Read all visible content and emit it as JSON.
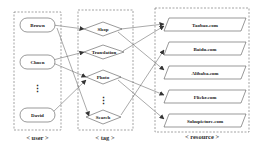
{
  "diagram": {
    "groups": {
      "user": {
        "caption": "< user >"
      },
      "tag": {
        "caption": "< tag >"
      },
      "resource": {
        "caption": "< resource >"
      }
    },
    "users": [
      {
        "id": "brown",
        "label": "Brown"
      },
      {
        "id": "chuen",
        "label": "Chuen"
      },
      {
        "id": "david",
        "label": "David"
      }
    ],
    "tags": [
      {
        "id": "shop",
        "label": "Shop"
      },
      {
        "id": "translation",
        "label": "Translation"
      },
      {
        "id": "photo",
        "label": "Photo"
      },
      {
        "id": "search",
        "label": "Search"
      }
    ],
    "resources": [
      {
        "id": "taobao",
        "label": "Taobao.com"
      },
      {
        "id": "baidu",
        "label": "Baidu.com"
      },
      {
        "id": "alibaba",
        "label": "Alibaba.com"
      },
      {
        "id": "flickr",
        "label": "Flickr.com"
      },
      {
        "id": "sohupicture",
        "label": "Sohupicture.com"
      }
    ],
    "ellipsis": "⋮",
    "edges": [
      {
        "from": "brown",
        "to": "shop"
      },
      {
        "from": "brown",
        "to": "search"
      },
      {
        "from": "chuen",
        "to": "translation"
      },
      {
        "from": "chuen",
        "to": "photo"
      },
      {
        "from": "david",
        "to": "photo"
      },
      {
        "from": "shop",
        "to": "taobao"
      },
      {
        "from": "shop",
        "to": "alibaba"
      },
      {
        "from": "translation",
        "to": "taobao"
      },
      {
        "from": "photo",
        "to": "flickr"
      },
      {
        "from": "photo",
        "to": "sohupicture"
      },
      {
        "from": "search",
        "to": "baidu"
      }
    ],
    "colors": {
      "stroke": "#555555",
      "dash": "#666666",
      "text": "#222222"
    }
  }
}
